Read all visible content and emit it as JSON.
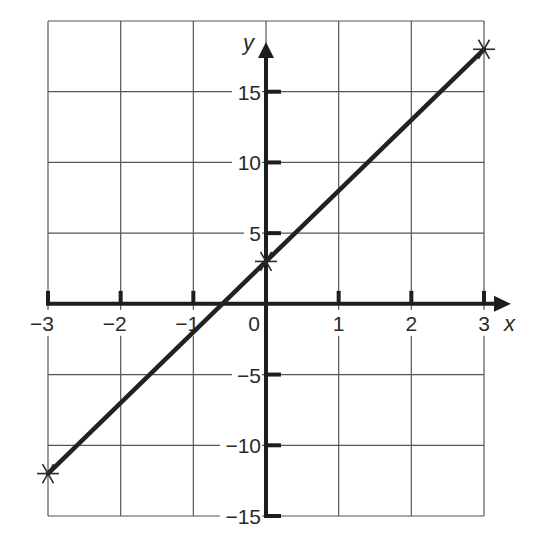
{
  "chart_data": {
    "type": "line",
    "title": "",
    "xlabel": "x",
    "ylabel": "y",
    "xlim": [
      -3,
      3
    ],
    "ylim": [
      -15,
      20
    ],
    "grid": true,
    "legend": null,
    "x_ticks": [
      -3,
      -2,
      -1,
      0,
      1,
      2,
      3
    ],
    "x_tick_labels": [
      "−3",
      "−2",
      "−1",
      "0",
      "1",
      "2",
      "3"
    ],
    "y_ticks": [
      -15,
      -10,
      -5,
      5,
      10,
      15
    ],
    "y_tick_labels": [
      "−15",
      "−10",
      "−5",
      "5",
      "10",
      "15"
    ],
    "series": [
      {
        "name": "y = 5x + 3",
        "x": [
          -3,
          0,
          3
        ],
        "y": [
          -12,
          3,
          18
        ],
        "marked_points": [
          [
            -3,
            -12
          ],
          [
            0,
            3
          ],
          [
            3,
            18
          ]
        ],
        "marker": "star"
      }
    ],
    "colors": {
      "line": "#222222",
      "grid": "#555555",
      "axis": "#1e1e1e"
    }
  }
}
